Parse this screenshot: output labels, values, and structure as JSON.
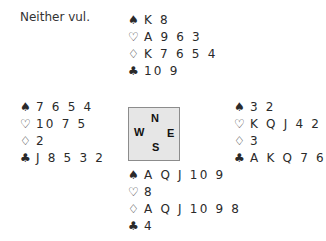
{
  "vulnerability": "Neither vul.",
  "suit_symbols": {
    "spades": "♠",
    "hearts": "♡",
    "diamonds": "♢",
    "clubs": "♣"
  },
  "hands": {
    "north": {
      "spades": "K 8",
      "hearts": "A 9 6 3",
      "diamonds": "K 7 6 5 4",
      "clubs": "10 9"
    },
    "west": {
      "spades": "7 6 5 4",
      "hearts": "10 7 5",
      "diamonds": "2",
      "clubs": "J 8 5 3 2"
    },
    "east": {
      "spades": "3 2",
      "hearts": "K Q J 4 2",
      "diamonds": "3",
      "clubs": "A K Q 7 6"
    },
    "south": {
      "spades": "A Q J 10 9",
      "hearts": "8",
      "diamonds": "A Q J 10 9 8",
      "clubs": "4"
    }
  },
  "compass": {
    "n": "N",
    "w": "W",
    "e": "E",
    "s": "S"
  }
}
